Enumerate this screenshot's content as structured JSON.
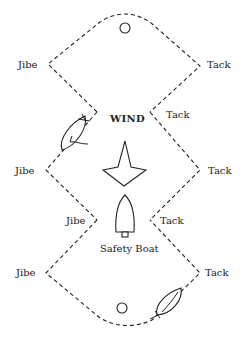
{
  "diagram": {
    "top_cutoff_text": "",
    "wind_label": "WIND",
    "safety_boat_label": "Safety Boat",
    "labels": {
      "jibe_top_left": "Jibe",
      "tack_top_right": "Tack",
      "tack_inner_upper_right": "Tack",
      "jibe_mid_left": "Jibe",
      "tack_mid_right": "Tack",
      "jibe_inner_lower_left": "Jibe",
      "tack_inner_lower_right": "Tack",
      "jibe_bottom_left": "Jibe",
      "tack_bottom_right": "Tack"
    },
    "marks": [
      {
        "name": "top-buoy"
      },
      {
        "name": "bottom-buoy"
      }
    ],
    "colors": {
      "ink": "#222222",
      "background": "#ffffff"
    }
  }
}
